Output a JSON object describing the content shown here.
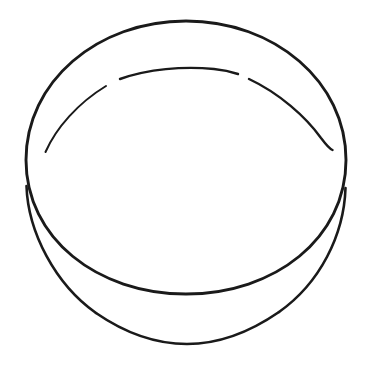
{
  "image": {
    "kind": "line-drawing",
    "subject_name": "round-lidded-container",
    "caption": "",
    "background_color": "#ffffff",
    "ink_color": "#1a1a1a",
    "canvas": {
      "width": 370,
      "height": 370
    },
    "text_content": [],
    "stroke_widths": {
      "outline": 2.9,
      "body": 2.6,
      "rim": 2.4
    }
  },
  "geometry": {
    "lid_ellipse": {
      "name": "lid-top-ellipse",
      "center_x": 186,
      "center_y": 156,
      "radius_x": 160,
      "radius_y": 136,
      "top_y": 20,
      "bottom_y": 292,
      "left_x": 26,
      "right_x": 346
    },
    "body_bottom_arc": {
      "name": "container-body-bottom",
      "left_anchor_x": 26,
      "left_anchor_y": 188,
      "right_anchor_x": 345,
      "right_anchor_y": 190,
      "lowest_y": 344,
      "lowest_x": 186
    },
    "inner_rim_arc": {
      "name": "lid-inner-rim",
      "left_end_x": 45,
      "left_end_y": 151,
      "right_end_x": 333,
      "right_end_y": 149,
      "apex_x": 186,
      "apex_y": 73,
      "segment_count": 3,
      "gap_count": 2,
      "gap_positions_x": [
        113,
        232
      ]
    }
  },
  "paths": {
    "lid_outline": "M 26 160 C 26 82 97 21 186 21 C 275 21 346 82 346 160 C 346 238 275 294 186 294 C 97 294 26 238 26 160 Z",
    "body_left_wall": "M 26.5 186 C 28 232 55 284 96 313",
    "body_bottom": "M 96 313 C 125 333 155 344 187 344 C 219 344 250 332 279 312",
    "body_right_wall": "M 279 312 C 320 283 344 235 345.5 188",
    "rim_left": "M 45.5 152 C 56 128 78 103 106 86",
    "rim_top": "M 120 79 C 148 69 183 66 214 69 C 224 70 232 72 238 74",
    "rim_right": "M 249 79 C 279 93 306 117 321 138 C 327 146 330 149 332.5 150"
  },
  "annotations": {
    "labels": [],
    "legend": []
  }
}
